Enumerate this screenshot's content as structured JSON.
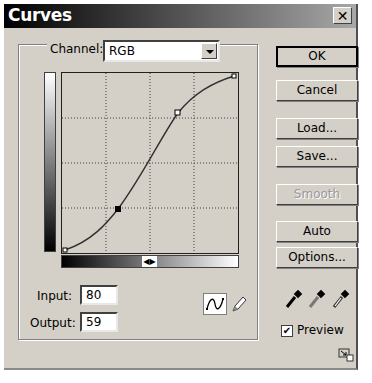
{
  "window": {
    "title": "Curves",
    "close_glyph": "✕"
  },
  "channel": {
    "label": "Channel:",
    "value": "RGB"
  },
  "graph": {
    "grid": "4x4 dotted",
    "curve_points": [
      {
        "input": 0,
        "output": 0
      },
      {
        "input": 80,
        "output": 59
      },
      {
        "input": 170,
        "output": 196
      },
      {
        "input": 255,
        "output": 255
      }
    ],
    "selected_point": 1,
    "slider_glyph": "◀▶"
  },
  "fields": {
    "input_label": "Input:",
    "input_value": "80",
    "output_label": "Output:",
    "output_value": "59"
  },
  "buttons": {
    "ok": "OK",
    "cancel": "Cancel",
    "load": "Load...",
    "save": "Save...",
    "smooth": "Smooth",
    "auto": "Auto",
    "options": "Options..."
  },
  "tools": {
    "curve_tool": "curve-icon",
    "pencil_tool": "pencil-icon",
    "eyedroppers": [
      "black-eyedropper-icon",
      "gray-eyedropper-icon",
      "white-eyedropper-icon"
    ]
  },
  "preview": {
    "label": "Preview",
    "checked": true,
    "check_glyph": "✔"
  },
  "colors": {
    "dialog_bg": "#d4d0c8",
    "title_start": "#000000",
    "title_end": "#a8a8a8"
  }
}
